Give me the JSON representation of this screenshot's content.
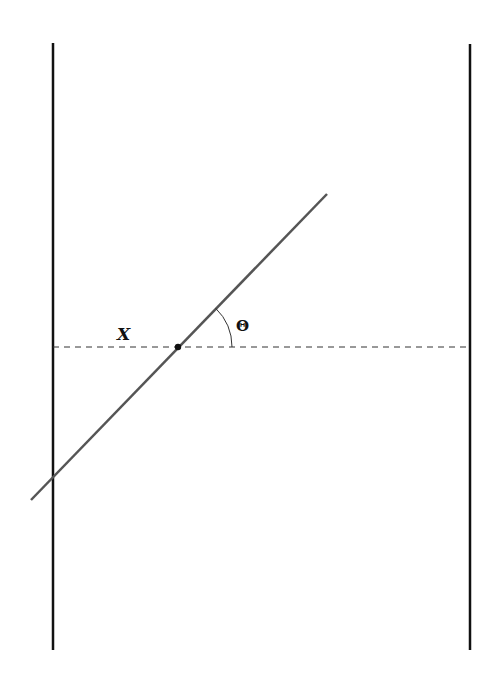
{
  "diagram": {
    "background": "#ffffff",
    "walls": {
      "left": {
        "x": 53,
        "y1": 43,
        "y2": 650,
        "color": "#111111"
      },
      "right": {
        "x": 470,
        "y1": 44,
        "y2": 650,
        "color": "#111111"
      }
    },
    "reference_line": {
      "style": "dashed",
      "y": 347,
      "x1": 53,
      "x2": 470,
      "color": "#333333"
    },
    "rod": {
      "x1": 31,
      "y1": 500,
      "x2": 327,
      "y2": 194,
      "color": "#555555"
    },
    "pivot_point": {
      "x": 178,
      "y": 347,
      "color": "#111111"
    },
    "labels": {
      "position_label": "X",
      "angle_label": "Θ"
    }
  }
}
